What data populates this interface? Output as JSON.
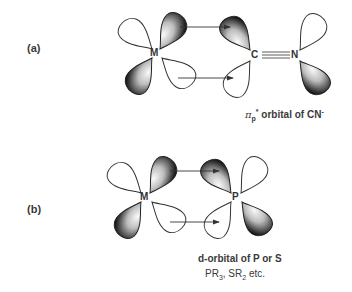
{
  "diagram": {
    "type": "orbital back-bonding diagram",
    "panels": [
      {
        "label": "(a)",
        "metal_atom": "M",
        "ligand_atoms": [
          "C",
          "N"
        ],
        "bond": "triple (C≡N)",
        "caption": {
          "pi_symbol": "π",
          "pi_subscript": "p",
          "pi_superscript": "*",
          "text": " orbital of CN",
          "charge": "-"
        },
        "arrows": [
          {
            "from": "M d-orbital (upper, shaded)",
            "to": "C π* lobe (upper, shaded)"
          },
          {
            "from": "M d-orbital (lower, open)",
            "to": "C π* lobe (lower, open)"
          }
        ]
      },
      {
        "label": "(b)",
        "metal_atom": "M",
        "ligand_atoms": [
          "P"
        ],
        "caption_line1": "d-orbital of P or S",
        "caption_line2": {
          "pr": "PR",
          "pr_sub": "3",
          "sep": ", SR",
          "sr_sub": "2",
          "tail": " etc."
        },
        "arrows": [
          {
            "from": "M d-orbital (upper, shaded)",
            "to": "P d-orbital (upper, shaded)"
          },
          {
            "from": "M d-orbital (lower, open)",
            "to": "P d-orbital (lower, open)"
          }
        ]
      }
    ],
    "colors": {
      "lobe_shaded_dark": "#1e1e1e",
      "lobe_shaded_light": "#f2f2f2",
      "lobe_outline": "#333333",
      "text": "#3a3a3a",
      "background": "#ffffff"
    }
  }
}
